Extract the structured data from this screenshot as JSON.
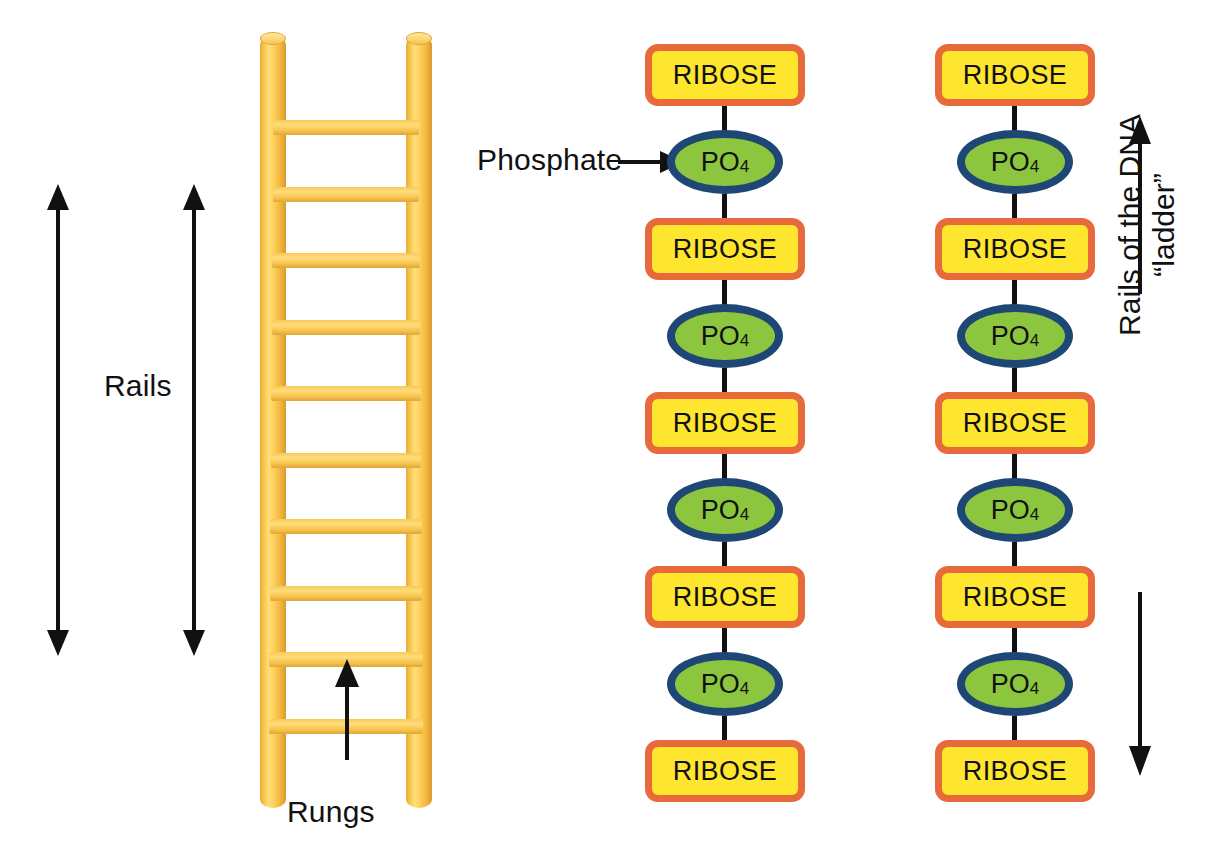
{
  "canvas": {
    "width": 1216,
    "height": 862,
    "background": "#ffffff"
  },
  "colors": {
    "ribose_fill": "#ffe62e",
    "ribose_border": "#e8693c",
    "po4_fill": "#8cc63f",
    "po4_border": "#1f4776",
    "bond": "#111111",
    "ladder_yellow": "#f7c44a",
    "arrow": "#111111",
    "text": "#111111"
  },
  "ladder": {
    "name": "wooden-ladder-illustration",
    "rung_count": 10,
    "rail_count": 2
  },
  "annotations": {
    "rails_label": "Rails",
    "rungs_label": "Rungs",
    "phosphate_label": "Phosphate",
    "dna_rails_label_line1": "Rails of the DNA",
    "dna_rails_label_line2": "“ladder”"
  },
  "chains": [
    {
      "name": "dna-backbone-chain-left",
      "units": [
        {
          "type": "ribose",
          "label": "RIBOSE"
        },
        {
          "type": "phosphate",
          "label": "PO",
          "subscript": "4"
        },
        {
          "type": "ribose",
          "label": "RIBOSE"
        },
        {
          "type": "phosphate",
          "label": "PO",
          "subscript": "4"
        },
        {
          "type": "ribose",
          "label": "RIBOSE"
        },
        {
          "type": "phosphate",
          "label": "PO",
          "subscript": "4"
        },
        {
          "type": "ribose",
          "label": "RIBOSE"
        },
        {
          "type": "phosphate",
          "label": "PO",
          "subscript": "4"
        },
        {
          "type": "ribose",
          "label": "RIBOSE"
        }
      ]
    },
    {
      "name": "dna-backbone-chain-right",
      "units": [
        {
          "type": "ribose",
          "label": "RIBOSE"
        },
        {
          "type": "phosphate",
          "label": "PO",
          "subscript": "4"
        },
        {
          "type": "ribose",
          "label": "RIBOSE"
        },
        {
          "type": "phosphate",
          "label": "PO",
          "subscript": "4"
        },
        {
          "type": "ribose",
          "label": "RIBOSE"
        },
        {
          "type": "phosphate",
          "label": "PO",
          "subscript": "4"
        },
        {
          "type": "ribose",
          "label": "RIBOSE"
        },
        {
          "type": "phosphate",
          "label": "PO",
          "subscript": "4"
        },
        {
          "type": "ribose",
          "label": "RIBOSE"
        }
      ]
    }
  ]
}
